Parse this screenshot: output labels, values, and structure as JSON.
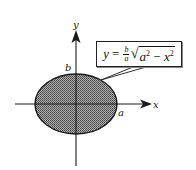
{
  "diagram": {
    "title": "",
    "axes": {
      "x_label": "x",
      "y_label": "y"
    },
    "ellipse": {
      "fill_pattern": "dotted-gray",
      "semi_axis_x_label": "a",
      "semi_axis_y_label": "b"
    },
    "equation": {
      "lhs": "y",
      "equals": "=",
      "frac_num": "b",
      "frac_den": "a",
      "radical": "√",
      "arg_a": "a",
      "exp_a": "2",
      "minus": " − ",
      "arg_x": "x",
      "exp_x": "2",
      "full_text": "y = (b/a)√(a² − x²)"
    },
    "colors": {
      "stroke": "#1a1a1a",
      "fill": "#8c8c8c",
      "background": "#ffffff"
    }
  }
}
